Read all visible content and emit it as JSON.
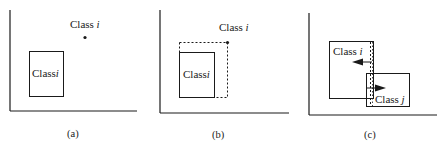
{
  "figure": {
    "panels": [
      {
        "id": "a",
        "caption": "(a)",
        "point_label": {
          "text": "Class ",
          "var": "i"
        },
        "box_label": {
          "text": "Class",
          "var": "i"
        }
      },
      {
        "id": "b",
        "caption": "(b)",
        "point_label": {
          "text": "Class ",
          "var": "i"
        },
        "box_label": {
          "text": "Class",
          "var": "i"
        }
      },
      {
        "id": "c",
        "caption": "(c)",
        "box_i_label": {
          "text": "Class ",
          "var": "i"
        },
        "box_j_label": {
          "text": "Class ",
          "var": "j"
        }
      }
    ],
    "colors": {
      "ink": "#1a1a1a",
      "background": "#ffffff"
    }
  }
}
